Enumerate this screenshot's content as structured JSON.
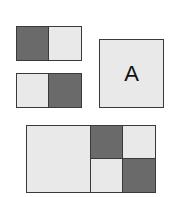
{
  "diagram": {
    "blocks": [
      {
        "id": "bar1",
        "cells": [
          "dark",
          "light"
        ]
      },
      {
        "id": "bar2",
        "cells": [
          "light",
          "dark"
        ]
      },
      {
        "id": "abox",
        "label": "A"
      },
      {
        "id": "grid",
        "left": "light",
        "quadrants": [
          "dark",
          "light",
          "light",
          "dark"
        ]
      }
    ],
    "colors": {
      "dark": "#6a6a6a",
      "light": "#e9e9e9",
      "border": "#3a3a3a"
    },
    "label_a": "A"
  }
}
